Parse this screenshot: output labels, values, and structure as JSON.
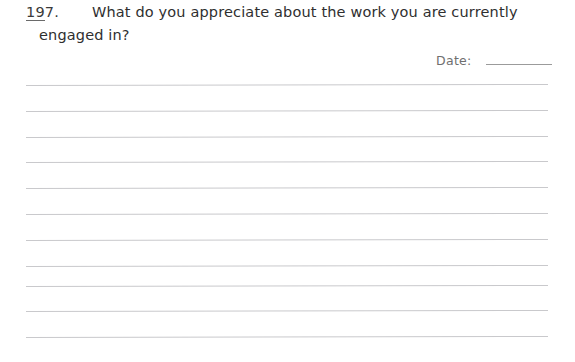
{
  "page": {
    "background_color": "#ffffff",
    "text_color": "#2f2f2f",
    "rule_color": "#c9c9cc",
    "width": 575,
    "height": 362
  },
  "question": {
    "number_underlined": "19",
    "number_rest": "7.",
    "number_full": "197.",
    "line1": "What do you appreciate about the work you are currently",
    "line2": "engaged in?",
    "full_text": "What do you appreciate about the work you are currently engaged in?"
  },
  "date_field": {
    "label": "Date:",
    "value": "",
    "placeholder": ""
  },
  "answer_area": {
    "line_count": 11,
    "line_top_positions": [
      85,
      111,
      137,
      162,
      188,
      214,
      240,
      266,
      286,
      311,
      337
    ],
    "line_left": 26,
    "line_width": 522
  }
}
